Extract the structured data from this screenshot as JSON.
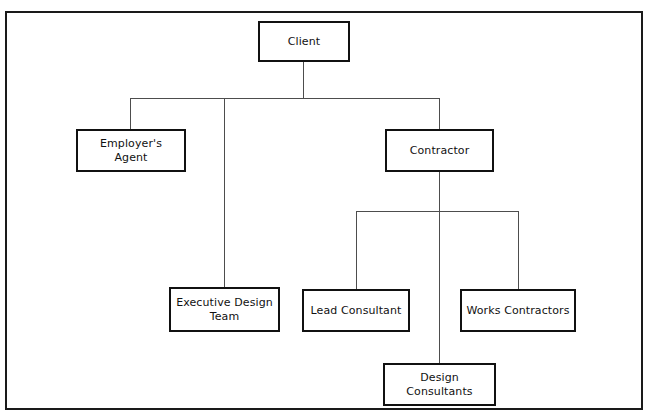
{
  "diagram": {
    "type": "org-chart",
    "frame": {
      "border_color": "#1a1a1a",
      "background": "#ffffff"
    },
    "line_color": "#4d4d4d",
    "box_border_color": "#111111",
    "nodes": [
      {
        "id": "client",
        "label": "Client",
        "level": 0
      },
      {
        "id": "employers-agent",
        "label": "Employer's Agent",
        "level": 1
      },
      {
        "id": "contractor",
        "label": "Contractor",
        "level": 1
      },
      {
        "id": "executive-design",
        "label": "Executive Design\nTeam",
        "level": 2
      },
      {
        "id": "lead-consultant",
        "label": "Lead Consultant",
        "level": 2
      },
      {
        "id": "works-contractors",
        "label": "Works Contractors",
        "level": 2
      },
      {
        "id": "design-consultants",
        "label": "Design Consultants",
        "level": 3
      }
    ],
    "edges": [
      {
        "from": "client",
        "to": "employers-agent"
      },
      {
        "from": "client",
        "to": "executive-design"
      },
      {
        "from": "client",
        "to": "contractor"
      },
      {
        "from": "contractor",
        "to": "lead-consultant"
      },
      {
        "from": "contractor",
        "to": "works-contractors"
      },
      {
        "from": "contractor",
        "to": "design-consultants"
      }
    ]
  }
}
